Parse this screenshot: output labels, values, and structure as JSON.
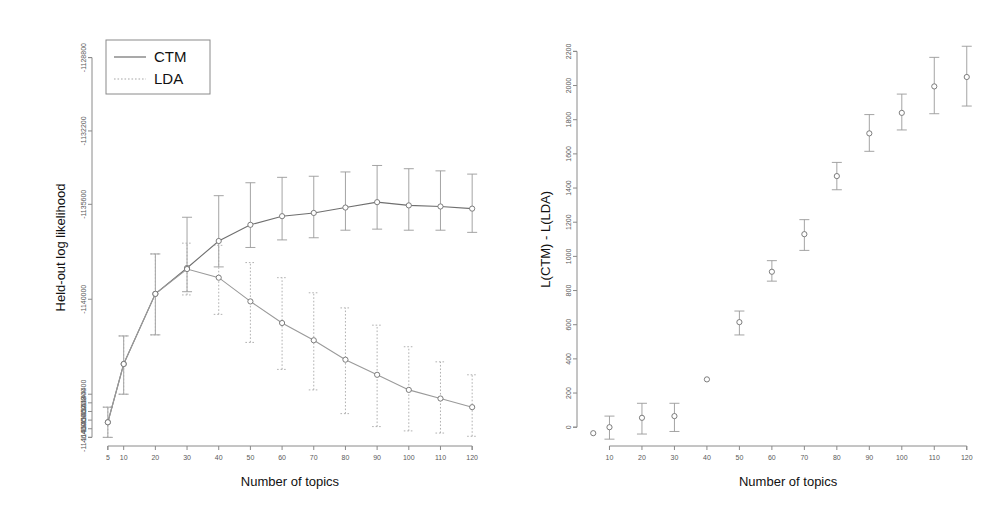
{
  "figure": {
    "background": "#ffffff",
    "colors": {
      "axis": "#8a8a8a",
      "ctm": "#6f6f6f",
      "lda": "#9a9a9a",
      "text": "#111111",
      "tick_text": "#5a5a5a"
    }
  },
  "chart_data": [
    {
      "type": "line",
      "panel": "left",
      "title": "",
      "xlabel": "Number of topics",
      "ylabel": "Held-out log likelihood",
      "grid": false,
      "legend_position": "top-left",
      "legend_entries": [
        {
          "label": "CTM",
          "style": "solid"
        },
        {
          "label": "LDA",
          "style": "dotted"
        }
      ],
      "x": [
        5,
        10,
        20,
        30,
        40,
        50,
        60,
        70,
        80,
        90,
        100,
        110,
        120
      ],
      "xticks": [
        5,
        10,
        20,
        30,
        40,
        50,
        60,
        70,
        80,
        90,
        100,
        110,
        120
      ],
      "xticklabels": [
        "5",
        "10",
        "20",
        "30",
        "40",
        "50",
        "60",
        "70",
        "80",
        "90",
        "100",
        "110",
        "120"
      ],
      "xlim": [
        0,
        125
      ],
      "yticks": [
        -1128800,
        -1132200,
        -1135600,
        -1140000,
        -1144400,
        -1144800,
        -1145200,
        -1145600,
        -1146000,
        -1146400
      ],
      "yticklabels": [
        "-1128800",
        "-1132200",
        "-1135600",
        "-1140000",
        "-1144400",
        "-1144800",
        "-1145200",
        "-1145600",
        "-1146000",
        "-1146400"
      ],
      "ylim": [
        -1146800,
        -1127800
      ],
      "series": [
        {
          "name": "CTM",
          "style": "solid",
          "values": [
            -1145700,
            -1143000,
            -1139750,
            -1138550,
            -1137300,
            -1136550,
            -1136150,
            -1136000,
            -1135750,
            -1135500,
            -1135650,
            -1135700,
            -1135800
          ],
          "err_low": [
            -1146400,
            -1144400,
            -1141650,
            -1139650,
            -1138500,
            -1137600,
            -1137250,
            -1137150,
            -1136800,
            -1136750,
            -1136800,
            -1136800,
            -1136900
          ],
          "err_high": [
            -1145000,
            -1141700,
            -1137900,
            -1136200,
            -1135200,
            -1134600,
            -1134350,
            -1134300,
            -1134100,
            -1133800,
            -1133950,
            -1134050,
            -1134200
          ]
        },
        {
          "name": "LDA",
          "style": "dotted",
          "values": [
            -1145700,
            -1143000,
            -1139750,
            -1138600,
            -1139000,
            -1140100,
            -1141100,
            -1141900,
            -1142800,
            -1143500,
            -1144200,
            -1144600,
            -1145000
          ],
          "err_low": [
            -1146400,
            -1144400,
            -1141650,
            -1139800,
            -1140700,
            -1142000,
            -1143250,
            -1144200,
            -1145300,
            -1145900,
            -1146100,
            -1146200,
            -1146350
          ],
          "err_high": [
            -1145000,
            -1141700,
            -1137900,
            -1137400,
            -1137500,
            -1138300,
            -1139000,
            -1139700,
            -1140400,
            -1141200,
            -1142200,
            -1142900,
            -1143500
          ]
        }
      ]
    },
    {
      "type": "scatter",
      "panel": "right",
      "title": "",
      "xlabel": "Number of topics",
      "ylabel": "L(CTM) - L(LDA)",
      "grid": false,
      "legend_position": "none",
      "x": [
        5,
        10,
        20,
        30,
        40,
        50,
        60,
        70,
        80,
        90,
        100,
        110,
        120
      ],
      "xticks": [
        10,
        20,
        30,
        40,
        50,
        60,
        70,
        80,
        90,
        100,
        110,
        120
      ],
      "xticklabels": [
        "10",
        "20",
        "30",
        "40",
        "50",
        "60",
        "70",
        "80",
        "90",
        "100",
        "110",
        "120"
      ],
      "xlim": [
        0,
        125
      ],
      "yticks": [
        0,
        200,
        400,
        600,
        800,
        1000,
        1200,
        1400,
        1600,
        1800,
        2000,
        2200
      ],
      "yticklabels": [
        "0",
        "200",
        "400",
        "600",
        "800",
        "1000",
        "1200",
        "1400",
        "1600",
        "1800",
        "2000",
        "2200"
      ],
      "ylim": [
        -110,
        2290
      ],
      "series": [
        {
          "name": "L(CTM) - L(LDA)",
          "style": "points",
          "values": [
            -35,
            0,
            55,
            65,
            280,
            615,
            910,
            1130,
            1470,
            1720,
            1840,
            1995,
            2050
          ],
          "err_low": [
            null,
            -70,
            -40,
            -25,
            null,
            540,
            855,
            1035,
            1390,
            1615,
            1740,
            1835,
            1880
          ],
          "err_high": [
            null,
            65,
            140,
            140,
            null,
            680,
            975,
            1215,
            1550,
            1830,
            1950,
            2165,
            2230
          ]
        }
      ]
    }
  ]
}
